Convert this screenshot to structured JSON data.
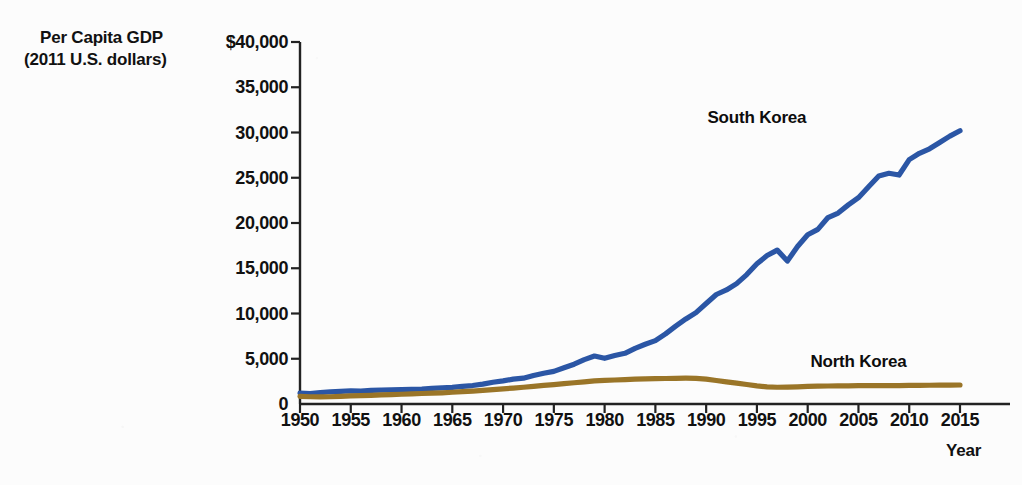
{
  "chart_data": {
    "type": "line",
    "title": "",
    "ylabel_line1": "Per Capita GDP",
    "ylabel_line2": "(2011 U.S. dollars)",
    "xlabel": "Year",
    "xlim": [
      1950,
      2015
    ],
    "ylim": [
      0,
      40000
    ],
    "grid": false,
    "legend_position": "inline-annotation",
    "ytick_labels": [
      "$40,000",
      "35,000",
      "30,000",
      "25,000",
      "20,000",
      "15,000",
      "10,000",
      "5,000",
      "0"
    ],
    "ytick_values": [
      40000,
      35000,
      30000,
      25000,
      20000,
      15000,
      10000,
      5000,
      0
    ],
    "xtick_labels": [
      "1950",
      "1955",
      "1960",
      "1965",
      "1970",
      "1975",
      "1980",
      "1985",
      "1990",
      "1995",
      "2000",
      "2005",
      "2010",
      "2015"
    ],
    "xtick_values": [
      1950,
      1955,
      1960,
      1965,
      1970,
      1975,
      1980,
      1985,
      1990,
      1995,
      2000,
      2005,
      2010,
      2015
    ],
    "series": [
      {
        "name": "South Korea",
        "color": "#2B56A5",
        "label_x": 1995,
        "label_y": 31600,
        "x": [
          1950,
          1951,
          1952,
          1953,
          1954,
          1955,
          1956,
          1957,
          1958,
          1959,
          1960,
          1961,
          1962,
          1963,
          1964,
          1965,
          1966,
          1967,
          1968,
          1969,
          1970,
          1971,
          1972,
          1973,
          1974,
          1975,
          1976,
          1977,
          1978,
          1979,
          1980,
          1981,
          1982,
          1983,
          1984,
          1985,
          1986,
          1987,
          1988,
          1989,
          1990,
          1991,
          1992,
          1993,
          1994,
          1995,
          1996,
          1997,
          1998,
          1999,
          2000,
          2001,
          2002,
          2003,
          2004,
          2005,
          2006,
          2007,
          2008,
          2009,
          2010,
          2011,
          2012,
          2013,
          2014,
          2015
        ],
        "y": [
          1200,
          1150,
          1250,
          1350,
          1400,
          1450,
          1430,
          1500,
          1540,
          1560,
          1580,
          1620,
          1640,
          1720,
          1780,
          1830,
          1950,
          2040,
          2200,
          2400,
          2550,
          2750,
          2850,
          3150,
          3400,
          3600,
          4000,
          4400,
          4900,
          5300,
          5050,
          5350,
          5600,
          6150,
          6600,
          7000,
          7750,
          8600,
          9400,
          10100,
          11100,
          12100,
          12600,
          13300,
          14300,
          15500,
          16400,
          17000,
          15800,
          17400,
          18700,
          19300,
          20600,
          21100,
          22000,
          22800,
          24000,
          25200,
          25500,
          25300,
          27000,
          27700,
          28200,
          28900,
          29600,
          30200
        ]
      },
      {
        "name": "North Korea",
        "color": "#9A7528",
        "label_x": 2005,
        "label_y": 4600,
        "x": [
          1950,
          1951,
          1952,
          1953,
          1954,
          1955,
          1956,
          1957,
          1958,
          1959,
          1960,
          1961,
          1962,
          1963,
          1964,
          1965,
          1966,
          1967,
          1968,
          1969,
          1970,
          1971,
          1972,
          1973,
          1974,
          1975,
          1976,
          1977,
          1978,
          1979,
          1980,
          1981,
          1982,
          1983,
          1984,
          1985,
          1986,
          1987,
          1988,
          1989,
          1990,
          1991,
          1992,
          1993,
          1994,
          1995,
          1996,
          1997,
          1998,
          1999,
          2000,
          2001,
          2002,
          2003,
          2004,
          2005,
          2006,
          2007,
          2008,
          2009,
          2010,
          2011,
          2012,
          2013,
          2014,
          2015
        ],
        "y": [
          850,
          800,
          780,
          800,
          850,
          900,
          930,
          960,
          1000,
          1040,
          1080,
          1120,
          1160,
          1200,
          1240,
          1300,
          1360,
          1420,
          1500,
          1580,
          1680,
          1760,
          1850,
          1950,
          2050,
          2150,
          2250,
          2350,
          2450,
          2550,
          2600,
          2650,
          2700,
          2740,
          2770,
          2800,
          2820,
          2840,
          2850,
          2840,
          2750,
          2600,
          2450,
          2300,
          2150,
          2000,
          1900,
          1850,
          1870,
          1900,
          1950,
          1970,
          1990,
          2000,
          2010,
          2020,
          2030,
          2040,
          2040,
          2030,
          2050,
          2060,
          2070,
          2080,
          2090,
          2100
        ]
      }
    ]
  },
  "axis": {
    "line_color": "#222222"
  }
}
